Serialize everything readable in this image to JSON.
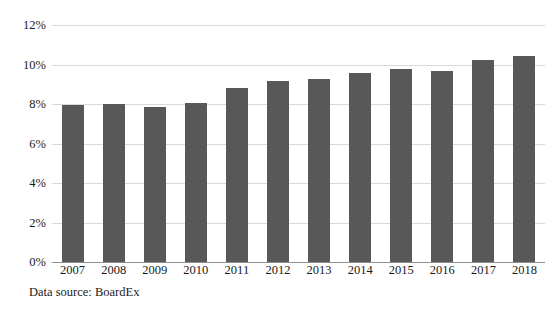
{
  "chart_data": {
    "type": "bar",
    "title": "",
    "subtitle": "",
    "xlabel": "",
    "ylabel": "",
    "categories": [
      "2007",
      "2008",
      "2009",
      "2010",
      "2011",
      "2012",
      "2013",
      "2014",
      "2015",
      "2016",
      "2017",
      "2018"
    ],
    "values": [
      7.95,
      7.98,
      7.85,
      8.05,
      8.8,
      9.15,
      9.25,
      9.55,
      9.75,
      9.65,
      10.25,
      10.45
    ],
    "ylim": [
      0,
      12
    ],
    "ytick_values": [
      0,
      2,
      4,
      6,
      8,
      10,
      12
    ],
    "ytick_labels": [
      "0%",
      "2%",
      "4%",
      "6%",
      "8%",
      "10%",
      "12%"
    ],
    "grid": true,
    "legend": null,
    "series_color": "#585858",
    "gridline_color": "#d9d9d9",
    "axis_color": "#8f8f8f"
  },
  "caption": {
    "text": "Data source: BoardEx"
  }
}
